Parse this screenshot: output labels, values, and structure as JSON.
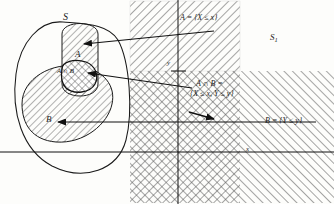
{
  "figure": {
    "type": "venn-to-plane mapping diagram",
    "sample_space_label": "S",
    "event_a_label": "A",
    "event_b_label": "B",
    "intersection_label": "A ∩ B",
    "plane_label_base": "S",
    "plane_label_sub": "1",
    "axis_x_tick_label": "x",
    "axis_y_tick_label": "y"
  },
  "annotations": {
    "a_definition": "A = {X ≤ x}",
    "ab_definition_line1": "A ∩ B =",
    "ab_definition_line2": "{X ≤ x, Y ≤ y}",
    "b_definition": "B = {Y ≤ y}"
  },
  "colors": {
    "ink": "#1a1a1a",
    "hatch": "#555555",
    "axis": "#111111",
    "background": "#fdfdfb"
  },
  "regions": [
    {
      "name": "A",
      "fill": "diagonal-hatch",
      "description": "half-plane X ≤ x"
    },
    {
      "name": "B",
      "fill": "diagonal-hatch",
      "description": "half-plane Y ≤ y"
    },
    {
      "name": "A ∩ B",
      "fill": "cross-hatch",
      "description": "quadrant X ≤ x and Y ≤ y"
    }
  ],
  "arrows": [
    {
      "name": "arrow-a",
      "from": "A = {X ≤ x}",
      "to": "A"
    },
    {
      "name": "arrow-ab",
      "from": "A ∩ B = {X ≤ x, Y ≤ y}",
      "to": "A ∩ B"
    },
    {
      "name": "arrow-b",
      "from": "B = {Y ≤ y}",
      "to": "B"
    }
  ]
}
